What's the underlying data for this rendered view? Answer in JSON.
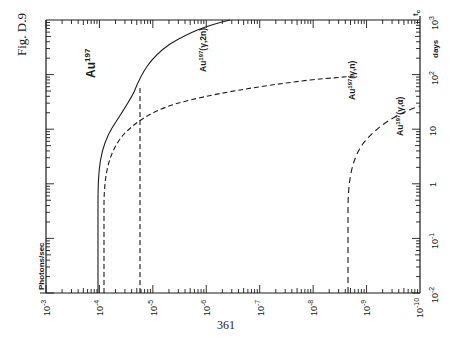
{
  "page": {
    "figure_label": "Fig. D.9",
    "page_number": "361"
  },
  "chart_data": {
    "type": "line",
    "orientation": "rotated 90° (printed sideways)",
    "title": "Au197",
    "xlabel": "Photons/sec",
    "ylabel": "days",
    "y_axis_marker": "t_c",
    "x_axis": {
      "scale": "log",
      "ticks": [
        "10^-3",
        "10^-4",
        "10^-5",
        "10^-6",
        "10^-7",
        "10^-8",
        "10^-9",
        "10^-10"
      ],
      "range": [
        0.001,
        1e-10
      ]
    },
    "y_axis": {
      "scale": "log",
      "ticks": [
        "10^-2",
        "10^-1",
        "1",
        "10",
        "10^2",
        "10^3"
      ],
      "range": [
        0.01,
        1000.0
      ]
    },
    "grid": false,
    "legend": "inline labels",
    "series": [
      {
        "name": "Au197(γ,2n)",
        "style": "solid",
        "points": [
          [
            0.0001,
            0.01
          ],
          [
            0.000102,
            1
          ],
          [
            0.000105,
            5
          ],
          [
            0.000115,
            10
          ],
          [
            0.00014,
            18
          ],
          [
            0.00018,
            30
          ],
          [
            0.0002,
            45
          ],
          [
            0.00023,
            80
          ],
          [
            0.00035,
            200
          ],
          [
            0.0007,
            500
          ],
          [
            1.5e-06,
            1000
          ]
        ]
      },
      {
        "name": "Au197(γ,n)",
        "style": "dashed",
        "points": [
          [
            0.000125,
            0.01
          ],
          [
            0.000127,
            1
          ],
          [
            0.000135,
            5
          ],
          [
            0.00016,
            10
          ],
          [
            0.00023,
            15
          ],
          [
            5e-05,
            25
          ],
          [
            3e-06,
            40
          ],
          [
            1e-07,
            60
          ],
          [
            4e-09,
            85
          ]
        ]
      },
      {
        "name": "Au197(γ,n) at 10^-5 cutoff",
        "style": "dashed-vertical",
        "points": [
          [
            1.7e-05,
            0.01
          ],
          [
            1.7e-05,
            100
          ]
        ]
      },
      {
        "name": "Au197(γ,α)",
        "style": "dashed",
        "points": [
          [
            5.5e-09,
            0.01
          ],
          [
            5.5e-09,
            1
          ],
          [
            6e-09,
            5
          ],
          [
            8e-09,
            15
          ],
          [
            1.2e-09,
            30
          ],
          [
            3e-10,
            50
          ],
          [
            1e-10,
            60
          ]
        ]
      }
    ],
    "annotations": [
      {
        "text": "Au",
        "sup": "197",
        "role": "title"
      },
      {
        "text": "Au",
        "sup": "197",
        "suffix": "(γ,2n)"
      },
      {
        "text": "Au",
        "sup": "197",
        "suffix": "(γ,n)"
      },
      {
        "text": "Au",
        "sup": "197",
        "suffix": "(γ,α)"
      }
    ]
  },
  "axis_labels": {
    "bottom": [
      {
        "base": "10",
        "exp": "-3"
      },
      {
        "base": "10",
        "exp": "-4"
      },
      {
        "base": "10",
        "exp": "-5"
      },
      {
        "base": "10",
        "exp": "-6"
      },
      {
        "base": "10",
        "exp": "-7"
      },
      {
        "base": "10",
        "exp": "-8"
      },
      {
        "base": "10",
        "exp": "-9"
      },
      {
        "base": "10",
        "exp": "-10"
      }
    ],
    "right": [
      {
        "base": "10",
        "exp": "3"
      },
      {
        "base": "10",
        "exp": "2"
      },
      {
        "base": "10",
        "exp": ""
      },
      {
        "base": "1",
        "exp": ""
      },
      {
        "base": "10",
        "exp": "-1"
      },
      {
        "base": "10",
        "exp": "-2"
      }
    ],
    "x_title": "Photons/sec",
    "y_title": "days",
    "tc": "t",
    "tc_sub": "c"
  },
  "labels": {
    "title_base": "Au",
    "title_sup": "197",
    "g2n_base": "Au",
    "g2n_sup": "197",
    "g2n_rxn": "(γ,2n)",
    "gn_base": "Au",
    "gn_sup": "197",
    "gn_rxn": "(γ,n)",
    "ga_base": "Au",
    "ga_sup": "197",
    "ga_rxn": "(γ,α)"
  }
}
